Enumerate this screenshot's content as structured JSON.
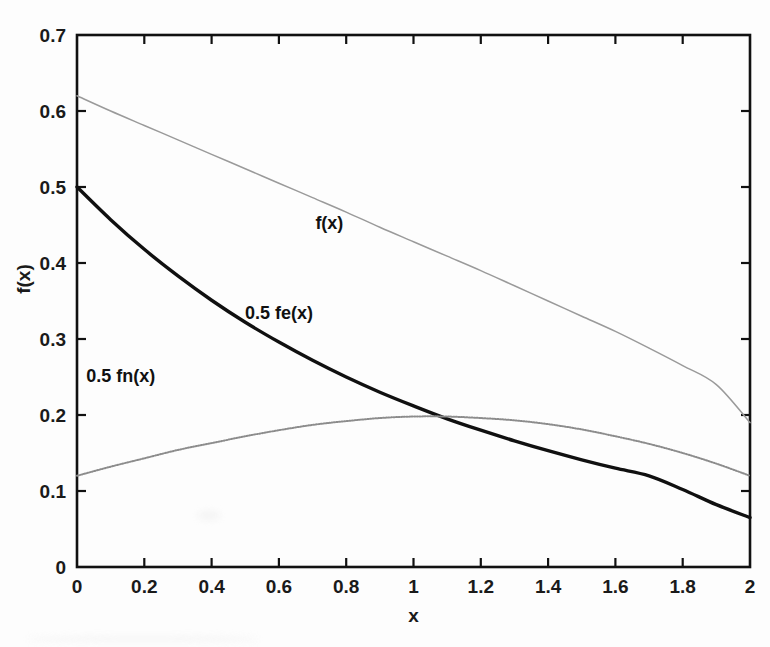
{
  "chart_data": {
    "type": "line",
    "title": "",
    "xlabel": "x",
    "ylabel": "f(x)",
    "xlim": [
      0,
      2
    ],
    "ylim": [
      0,
      0.7
    ],
    "grid": false,
    "legend_position": "inline-annotations",
    "xticks": [
      "0",
      "0.2",
      "0.4",
      "0.6",
      "0.8",
      "1",
      "1.2",
      "1.4",
      "1.6",
      "1.8",
      "2"
    ],
    "xtick_values": [
      0,
      0.2,
      0.4,
      0.6,
      0.8,
      1,
      1.2,
      1.4,
      1.6,
      1.8,
      2
    ],
    "yticks": [
      "0",
      "0.1",
      "0.2",
      "0.3",
      "0.4",
      "0.5",
      "0.6",
      "0.7"
    ],
    "ytick_values": [
      0,
      0.1,
      0.2,
      0.3,
      0.4,
      0.5,
      0.6,
      0.7
    ],
    "x": [
      0,
      0.1,
      0.2,
      0.3,
      0.4,
      0.5,
      0.6,
      0.7,
      0.8,
      0.9,
      1.0,
      1.1,
      1.2,
      1.3,
      1.4,
      1.5,
      1.6,
      1.7,
      1.8,
      1.9,
      2.0
    ],
    "series": [
      {
        "name": "f(x)",
        "color": "#9a9a9a",
        "style": "thin-solid",
        "annotation": "f(x)",
        "annotation_x": 0.75,
        "annotation_y": 0.445,
        "values": [
          0.62,
          0.6,
          0.581,
          0.562,
          0.543,
          0.524,
          0.505,
          0.486,
          0.467,
          0.447,
          0.428,
          0.409,
          0.39,
          0.37,
          0.35,
          0.33,
          0.31,
          0.288,
          0.265,
          0.24,
          0.19
        ]
      },
      {
        "name": "0.5 fe(x)",
        "color": "#101010",
        "style": "thick-solid",
        "annotation": "0.5 fe(x)",
        "annotation_x": 0.6,
        "annotation_y": 0.326,
        "values": [
          0.5,
          0.457,
          0.418,
          0.383,
          0.351,
          0.322,
          0.296,
          0.272,
          0.25,
          0.23,
          0.212,
          0.195,
          0.18,
          0.166,
          0.153,
          0.141,
          0.13,
          0.12,
          0.102,
          0.082,
          0.065
        ]
      },
      {
        "name": "0.5 fn(x)",
        "color": "#8c8c8c",
        "style": "dotted",
        "annotation": "0.5 fn(x)",
        "annotation_x": 0.13,
        "annotation_y": 0.243,
        "values": [
          0.12,
          0.132,
          0.143,
          0.154,
          0.163,
          0.172,
          0.18,
          0.187,
          0.192,
          0.196,
          0.198,
          0.198,
          0.196,
          0.193,
          0.188,
          0.181,
          0.172,
          0.162,
          0.15,
          0.136,
          0.12
        ]
      }
    ],
    "axes_box": {
      "left": 77,
      "right": 750,
      "top": 35,
      "bottom": 567
    }
  }
}
